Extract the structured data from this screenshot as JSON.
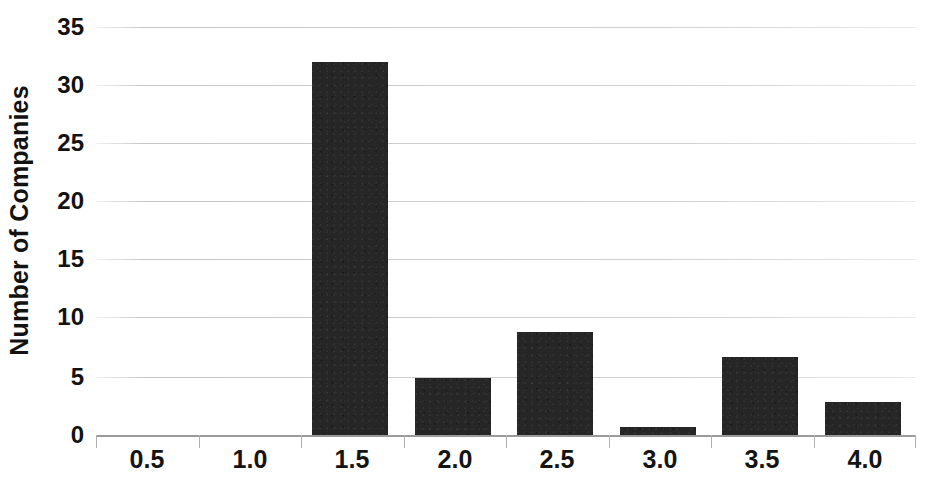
{
  "chart_data": {
    "type": "bar",
    "title": "",
    "subtitle": "",
    "xlabel": "",
    "ylabel": "Number of Companies",
    "categories": [
      "0.5",
      "1.0",
      "1.5",
      "2.0",
      "2.5",
      "3.0",
      "3.5",
      "4.0"
    ],
    "values": [
      0,
      0,
      32,
      4.9,
      8.8,
      0.7,
      6.7,
      2.8
    ],
    "ylim": [
      0,
      35
    ],
    "ytick_values": [
      0,
      5,
      10,
      15,
      20,
      25,
      30,
      35
    ],
    "ytick_labels": [
      "0",
      "5",
      "10",
      "15",
      "20",
      "25",
      "30",
      "35"
    ],
    "xtick_labels": [
      "0.5",
      "1.0",
      "1.5",
      "2.0",
      "2.5",
      "3.0",
      "3.5",
      "4.0"
    ],
    "grid": true,
    "grid_axis": "y",
    "legend": false,
    "legend_position": "none",
    "bar_color": "#262626",
    "grid_color": "#d3d3d3",
    "axis_color": "#9a9a9a",
    "background_color": "#ffffff",
    "text_color": "#121212",
    "annotations": []
  }
}
